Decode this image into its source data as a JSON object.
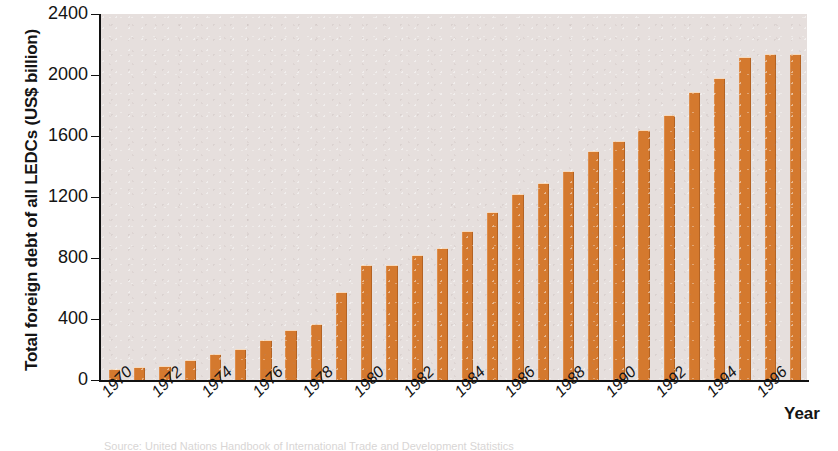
{
  "chart_data": {
    "type": "bar",
    "title": "",
    "xlabel": "Year",
    "ylabel": "Total foreign debt of all LEDCs (US$ billion)",
    "ylim": [
      0,
      2400
    ],
    "ytick_values": [
      0,
      400,
      800,
      1200,
      1600,
      2000,
      2400
    ],
    "ytick_labels": [
      "0",
      "400",
      "800",
      "1200",
      "1600",
      "2000",
      "2400"
    ],
    "xtick_labels": [
      "1970",
      "1972",
      "1974",
      "1976",
      "1978",
      "1980",
      "1982",
      "1984",
      "1986",
      "1988",
      "1990",
      "1992",
      "1994",
      "1996"
    ],
    "grid": false,
    "legend": null,
    "bar_color": "#d4792e",
    "plot_background": "#e6dfdd",
    "categories": [
      "1970",
      "1971",
      "1972",
      "1973",
      "1974",
      "1975",
      "1976",
      "1977",
      "1978",
      "1979",
      "1980",
      "1981",
      "1982",
      "1983",
      "1984",
      "1985",
      "1986",
      "1987",
      "1988",
      "1989",
      "1990",
      "1991",
      "1992",
      "1993",
      "1994",
      "1995",
      "1996",
      "1997"
    ],
    "values": [
      70,
      85,
      95,
      130,
      170,
      205,
      265,
      325,
      370,
      580,
      755,
      755,
      820,
      865,
      975,
      1100,
      1220,
      1290,
      1370,
      1500,
      1570,
      1640,
      1740,
      1890,
      1980,
      2120,
      2135,
      2140
    ]
  },
  "axes": {
    "y_title": "Total foreign debt of all LEDCs (US$ billion)",
    "x_title": "Year"
  },
  "caption": {
    "source_text": "Source: United Nations Handbook of International Trade and Development Statistics"
  }
}
